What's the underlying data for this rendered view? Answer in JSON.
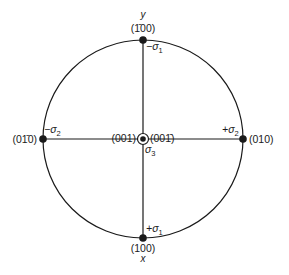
{
  "diagram": {
    "type": "stereographic-projection",
    "colors": {
      "line": "#1a1a1a",
      "background": "#ffffff"
    },
    "axes": {
      "y_label": "y",
      "x_label": "x"
    },
    "poles": {
      "top": {
        "index": "(1̄00)",
        "stress": "−σ",
        "stress_sub": "1"
      },
      "bottom": {
        "index": "(100)",
        "stress": "+σ",
        "stress_sub": "1"
      },
      "left": {
        "index": "(01̄0)",
        "stress": "−σ",
        "stress_sub": "2"
      },
      "right": {
        "index": "(010)",
        "stress": "+σ",
        "stress_sub": "2"
      },
      "center_left": {
        "index": "(001)"
      },
      "center_right": {
        "index": "(001̄)"
      },
      "center": {
        "stress": "σ",
        "stress_sub": "3"
      }
    }
  }
}
